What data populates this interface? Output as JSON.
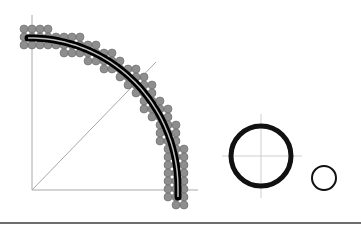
{
  "diagram": {
    "colors": {
      "axis": "#a8a8a8",
      "dot_fill": "#8e8e8e",
      "dot_stroke": "#666666",
      "path_black": "#000000",
      "path_line": "#bdbdbd",
      "circle": "#111111",
      "bottom_rule": "#6e6e6e"
    },
    "axes": {
      "vertical": {
        "x": 32,
        "y1": 15,
        "y2": 190
      },
      "horizontal": {
        "y": 190,
        "x1": 32,
        "x2": 198
      },
      "diagonal": {
        "x1": 32,
        "y1": 190,
        "x2": 156,
        "y2": 62
      }
    },
    "arc": {
      "center": [
        30,
        188
      ],
      "rx": 148,
      "ry": 150,
      "start_point": [
        28,
        38
      ],
      "end_point": [
        178,
        197
      ],
      "band_halfwidth": 11,
      "grid_spacing": 8,
      "grid_origin": [
        24,
        29
      ],
      "dot_radius": 4
    },
    "circles": {
      "large": {
        "cx": 261,
        "cy": 156,
        "r": 30,
        "stroke_width": 5,
        "crosshair_h": [
          222,
          302
        ],
        "crosshair_v": [
          114,
          198
        ]
      },
      "small": {
        "cx": 324,
        "cy": 178,
        "r": 12,
        "stroke_width": 2
      }
    },
    "bottom_rule": {
      "y": 223,
      "x1": 0,
      "x2": 361
    }
  }
}
